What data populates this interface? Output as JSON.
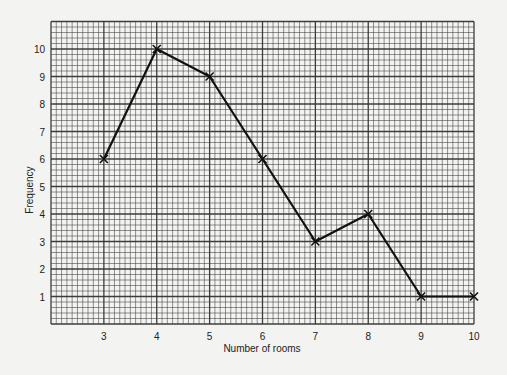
{
  "chart_data": {
    "type": "line",
    "title": "",
    "xlabel": "Number of rooms",
    "ylabel": "Frequency",
    "x": [
      3,
      4,
      5,
      6,
      7,
      8,
      9,
      10
    ],
    "series": [
      {
        "name": "Frequency",
        "values": [
          6,
          10,
          9,
          6,
          3,
          4,
          1,
          1
        ],
        "marker": "x",
        "color": "#111111"
      }
    ],
    "xlim": [
      2,
      10
    ],
    "ylim": [
      0,
      11
    ],
    "xticks": [
      3,
      4,
      5,
      6,
      7,
      8,
      9,
      10
    ],
    "yticks": [
      1,
      2,
      3,
      4,
      5,
      6,
      7,
      8,
      9,
      10
    ],
    "grid": true,
    "grid_style": "graph paper: 10 minor divisions per x-unit, 5 per y-unit",
    "legend": null
  },
  "labels": {
    "xlabel": "Number of rooms",
    "ylabel": "Frequency"
  },
  "colors": {
    "background": "#f3f3f1",
    "grid": "#333333",
    "line": "#111111"
  }
}
